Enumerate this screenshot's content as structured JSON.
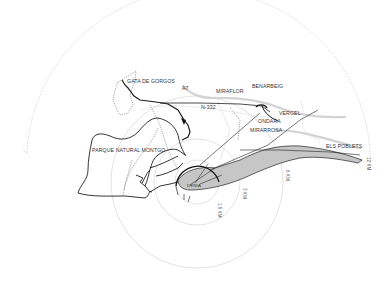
{
  "map": {
    "center": {
      "x": 197,
      "y": 182
    },
    "colors": {
      "background": "#ffffff",
      "radius_circle": "#bdbdbd",
      "coast": "#222222",
      "road_main": "#222222",
      "road_secondary": "#9a9a9a",
      "dashed_boundary": "#666666",
      "urban_fill": "#c8c8c8",
      "river_gray": "#d4d4d4"
    },
    "radii": [
      {
        "label": "1.5 KM",
        "r": 22
      },
      {
        "label": "3 KM",
        "r": 43
      },
      {
        "label": "6 KM",
        "r": 86
      },
      {
        "label": "12 KM",
        "r": 164
      }
    ],
    "places": [
      {
        "name": "GATA DE GORGOS",
        "x": 127,
        "y": 83
      },
      {
        "name": "A7",
        "x": 182,
        "y": 90
      },
      {
        "name": "MIRAFLOR",
        "x": 216,
        "y": 93
      },
      {
        "name": "BENARBEIG",
        "x": 252,
        "y": 88
      },
      {
        "name": "N-332",
        "x": 201,
        "y": 109
      },
      {
        "name": "VERGEL",
        "x": 279,
        "y": 115
      },
      {
        "name": "ONDARA",
        "x": 258,
        "y": 123
      },
      {
        "name": "MIRARROSA",
        "x": 250,
        "y": 132
      },
      {
        "name": "PARQUE NATURAL MONTGO",
        "x": 92,
        "y": 152
      },
      {
        "name": "DENIA",
        "x": 191,
        "y": 185
      },
      {
        "name": "ELS POBLETS",
        "x": 326,
        "y": 148
      }
    ]
  }
}
